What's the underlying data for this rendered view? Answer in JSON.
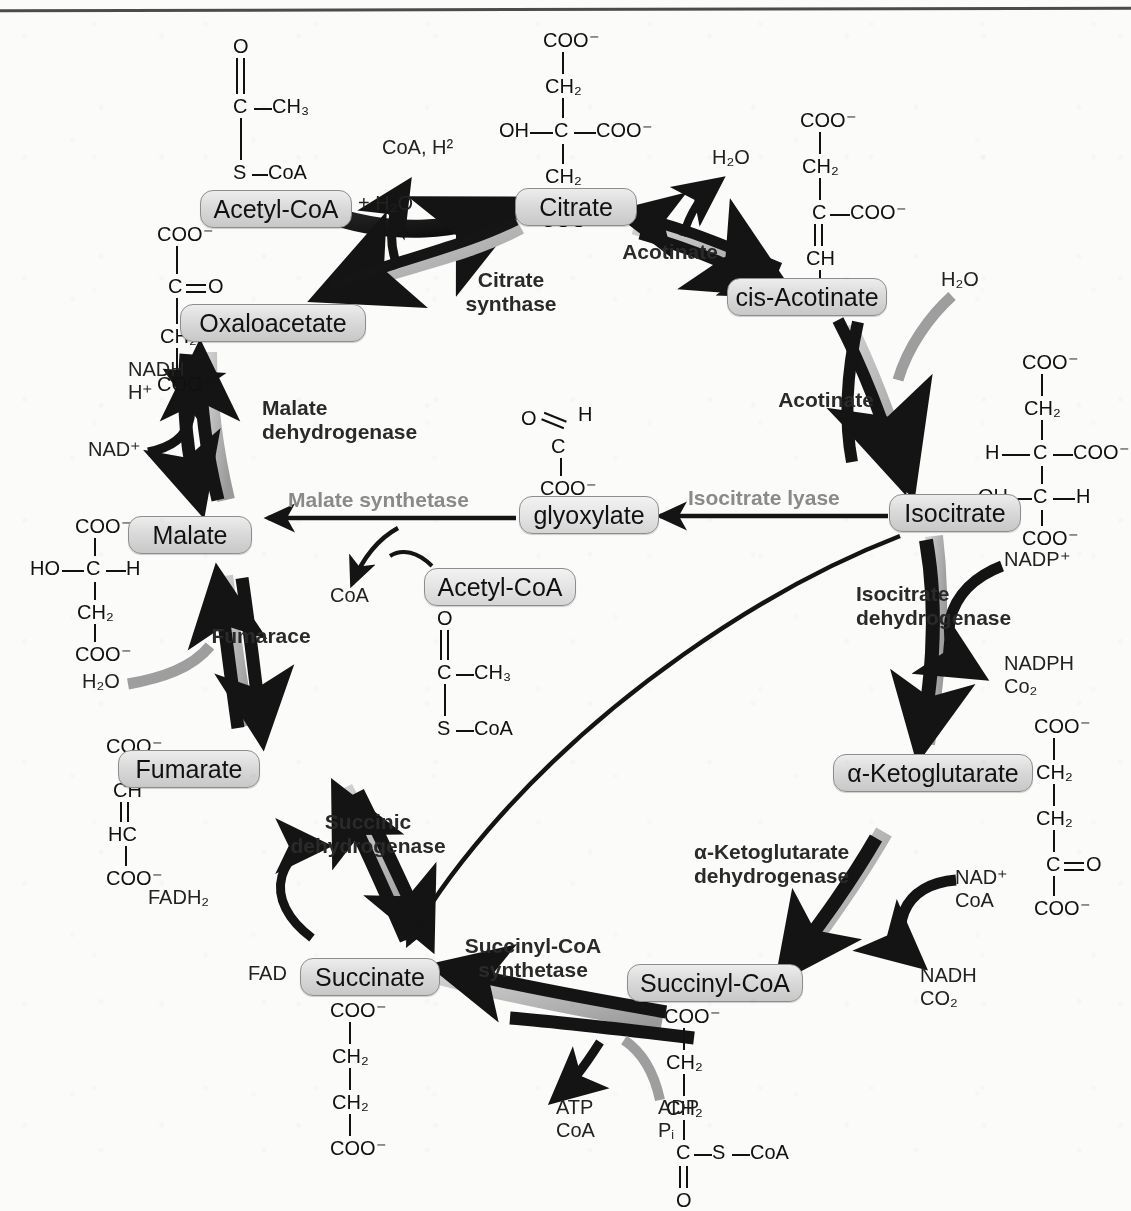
{
  "figure": {
    "accent_box_fill": "#d9d9d9",
    "accent_box_border": "#8d8d8d",
    "arrow_dark": "#1c1c1c",
    "arrow_light": "#b4b4b4",
    "enzyme_gray": "#8a8a8a"
  },
  "metabolites": {
    "acetyl_coa_top": "Acetyl-CoA",
    "citrate": "Citrate",
    "cis_acotinate": "cis-Acotinate",
    "isocitrate": "Isocitrate",
    "alpha_ketoglutarate": "α-Ketoglutarate",
    "succinyl_coa": "Succinyl-CoA",
    "succinate": "Succinate",
    "fumarate": "Fumarate",
    "malate": "Malate",
    "oxaloacetate": "Oxaloacetate",
    "glyoxylate": "glyoxylate",
    "acetyl_coa_center": "Acetyl-CoA"
  },
  "enzymes": {
    "citrate_synthase": "Citrate\nsynthase",
    "acotinate_1": "Acotinate",
    "acotinate_2": "Acotinate",
    "isocitrate_dehydrogenase": "Isocitrate\ndehydrogenase",
    "alpha_kg_dehydrogenase": "α-Ketoglutarate\ndehydrogenase",
    "succinyl_coa_synthetase": "Succinyl-CoA\nsynthetase",
    "succinic_dehydrogenase": "Succinic\ndehydrogenase",
    "fumarace": "Fumarace",
    "malate_dehydrogenase": "Malate\ndehydrogenase",
    "malate_synthetase": "Malate synthetase",
    "isocitrate_lyase": "Isocitrate lyase"
  },
  "cofactors": {
    "plus_h2o_acetyl": "+ H₂O",
    "coa_h_out": "CoA, H²",
    "h2o_citrate_out": "H₂O",
    "h2o_acotinate_in": "H₂O",
    "nadp_in": "NADP⁺",
    "nadph_co2_out": "NADPH\nCo₂",
    "nad_coa_in": "NAD⁺\nCoA",
    "nadh_co2_out": "NADH\nCO₂",
    "adp_pi_in": "ADP\nP",
    "adp_pi_sub": "i",
    "atp_coa_out": "ATP\nCoA",
    "fad_in": "FAD",
    "fadh2_out": "FADH₂",
    "h2o_fumarace_in": "H₂O",
    "nad_in_mdh": "NAD⁺",
    "nadh_h_out": "NADH\nH⁺",
    "coa_out_synthetase": "CoA"
  },
  "structures": {
    "acetyl_coa_top": [
      "O",
      "C",
      "CH₃",
      "S",
      "CoA"
    ],
    "oxaloacetate": [
      "COO⁻",
      "C",
      "O",
      "CH₂",
      "COO⁻"
    ],
    "citrate": [
      "COO⁻",
      "CH₂",
      "OH",
      "C",
      "COO⁻",
      "CH₂",
      "COO⁻"
    ],
    "cis_acotinate": [
      "COO⁻",
      "CH₂",
      "C",
      "COO⁻",
      "CH",
      "COO⁻"
    ],
    "isocitrate": [
      "COO⁻",
      "CH₂",
      "H",
      "C",
      "COO⁻",
      "OH",
      "C",
      "H",
      "COO⁻"
    ],
    "alpha_ketoglutarate": [
      "COO⁻",
      "CH₂",
      "CH₂",
      "C",
      "O",
      "COO⁻"
    ],
    "succinyl_coa": [
      "COO⁻",
      "CH₂",
      "CH₂",
      "C",
      "S",
      "CoA",
      "O"
    ],
    "succinate": [
      "COO⁻",
      "CH₂",
      "CH₂",
      "COO⁻"
    ],
    "fumarate": [
      "COO⁻",
      "CH",
      "HC",
      "COO⁻"
    ],
    "malate": [
      "COO⁻",
      "HO",
      "C",
      "H",
      "CH₂",
      "COO⁻"
    ],
    "glyoxylate": [
      "O",
      "C",
      "H",
      "COO⁻"
    ],
    "acetyl_coa_center": [
      "O",
      "C",
      "CH₃",
      "S",
      "CoA"
    ]
  }
}
